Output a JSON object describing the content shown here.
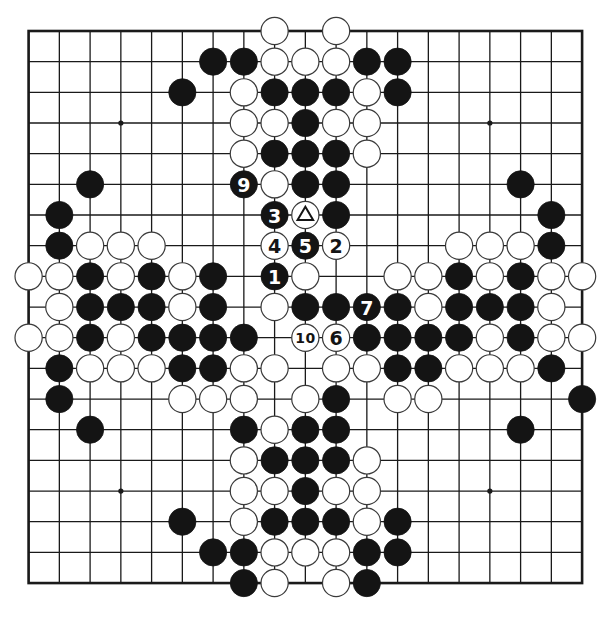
{
  "board": {
    "size": 19,
    "origin_x": 28.6,
    "origin_y": 31,
    "spacing_x": 30.75,
    "spacing_y": 30.67,
    "stone_radius": 13.6,
    "colors": {
      "background": "#ffffff",
      "line": "#1a1a1a",
      "black_stone": "#141414",
      "white_stone": "#ffffff",
      "stone_outline": "#3a3a3a"
    },
    "star_points": [
      [
        3,
        3
      ],
      [
        15,
        3
      ],
      [
        3,
        15
      ],
      [
        15,
        15
      ]
    ],
    "rows_legend": "Each string is one board row (top to bottom), 19 chars, columns left to right: B = black stone, W = white stone, . = empty",
    "rows": [
      "........W.W........",
      "......BBWWWBB......",
      ".....B.WBBBWB......",
      ".......WWBWW.......",
      ".......WBBBW.......",
      "..B....BWBB.....B..",
      ".B......BWB......B.",
      ".BWWW...WBW...WWWB.",
      "WWBWBWB.BW..WWBWBWW",
      ".WBBBWB.WBBBBWBBBW.",
      "WWBWBBBB.WWBBBBWBWW",
      ".BWWWBBWW.WWBBWWWB.",
      ".B...WWW.WB.WW....B",
      "..B....BWBB.....B..",
      ".......WBBBW.......",
      ".......WWBWW.......",
      ".....B.WBBBWB......",
      "......BBWWWBB......",
      ".......BW.WB......."
    ],
    "annotations": [
      {
        "col": 8,
        "row": 8,
        "color": "B",
        "label": "1"
      },
      {
        "col": 10,
        "row": 7,
        "color": "W",
        "label": "2"
      },
      {
        "col": 8,
        "row": 6,
        "color": "B",
        "label": "3"
      },
      {
        "col": 8,
        "row": 7,
        "color": "W",
        "label": "4"
      },
      {
        "col": 9,
        "row": 7,
        "color": "B",
        "label": "5"
      },
      {
        "col": 10,
        "row": 10,
        "color": "W",
        "label": "6"
      },
      {
        "col": 11,
        "row": 9,
        "color": "B",
        "label": "7"
      },
      {
        "col": 7,
        "row": 5,
        "color": "B",
        "label": "9"
      },
      {
        "col": 9,
        "row": 10,
        "color": "W",
        "label": "10"
      },
      {
        "col": 9,
        "row": 6,
        "color": "W",
        "label": "triangle"
      }
    ]
  }
}
